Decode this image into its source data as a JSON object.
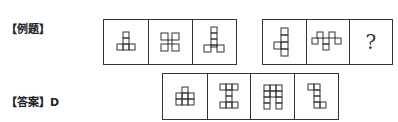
{
  "header_cutoff_text": "",
  "example": {
    "label": "【例题】",
    "group1": [
      {
        "figure": "t-shape-tower-icon"
      },
      {
        "figure": "four-corner-squares-icon"
      },
      {
        "figure": "tall-tower-y-icon"
      }
    ],
    "group2": [
      {
        "figure": "cross-shape-icon"
      },
      {
        "figure": "zigzag-squares-icon"
      },
      {
        "figure": "question",
        "text": "?"
      }
    ]
  },
  "options": [
    {
      "letter": "A",
      "figure": "stacked-grid-icon"
    },
    {
      "letter": "B",
      "figure": "i-beam-icon"
    },
    {
      "letter": "C",
      "figure": "arch-grid-icon"
    },
    {
      "letter": "D",
      "figure": "step-shape-icon"
    }
  ],
  "answer": {
    "label": "【答案】D"
  }
}
